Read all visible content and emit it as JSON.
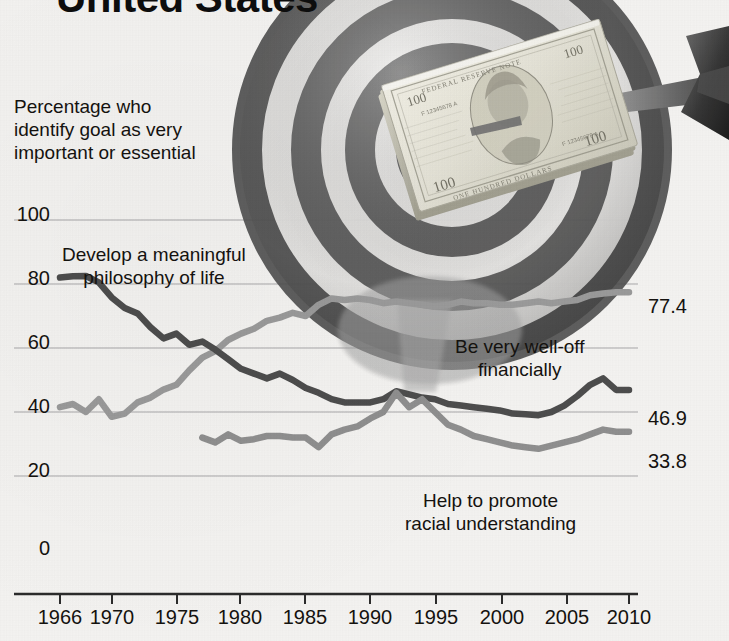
{
  "headline": "United States",
  "axis_note": "Percentage who\nidentify goal as very\nimportant or essential",
  "annotations": {
    "philosophy": "Develop a meaningful\nphilosophy of life",
    "wealth": "Be very well-off\nfinancially",
    "racial": "Help to promote\nracial understanding"
  },
  "end_labels": {
    "wealth": "77.4",
    "philosophy": "46.9",
    "racial": "33.8"
  },
  "y_ticks": [
    "100",
    "80",
    "60",
    "40",
    "20",
    "0"
  ],
  "x_ticks": [
    "1966",
    "1970",
    "1975",
    "1980",
    "1985",
    "1990",
    "1995",
    "2000",
    "2005",
    "2010"
  ],
  "colors": {
    "philosophy_line": "#4d4d4d",
    "wealth_line": "#9a9a9a",
    "racial_line": "#8f8f8f",
    "gridline": "#b9b9b9",
    "axis": "#2b2b2b",
    "text": "#14120f",
    "background": "#f4f3f1"
  },
  "imagery": {
    "dartboard": "dartboard-photo",
    "dart": "dart-photo",
    "money": "hundred-dollar-bills-photo"
  },
  "chart_data": {
    "type": "line",
    "title": "United States",
    "subtitle": "Percentage who identify goal as very important or essential",
    "xlabel": "",
    "ylabel": "Percentage",
    "xlim": [
      1966,
      2010
    ],
    "ylim": [
      0,
      100
    ],
    "grid": true,
    "legend": "inline-annotations",
    "x": [
      1966,
      1967,
      1968,
      1969,
      1970,
      1971,
      1972,
      1973,
      1974,
      1975,
      1976,
      1977,
      1978,
      1979,
      1980,
      1981,
      1982,
      1983,
      1984,
      1985,
      1986,
      1987,
      1988,
      1989,
      1990,
      1991,
      1992,
      1993,
      1994,
      1995,
      1996,
      1997,
      1998,
      1999,
      2000,
      2001,
      2002,
      2003,
      2004,
      2005,
      2006,
      2007,
      2008,
      2009
    ],
    "series": [
      {
        "name": "Develop a meaningful philosophy of life",
        "color": "#4d4d4d",
        "end_value": 46.9,
        "values": [
          82.0,
          82.4,
          82.5,
          80.5,
          75.8,
          72.5,
          70.8,
          66.5,
          63.0,
          64.5,
          61.0,
          62.0,
          59.5,
          56.5,
          53.5,
          52.0,
          50.5,
          52.0,
          50.0,
          47.5,
          46.0,
          44.0,
          43.0,
          43.0,
          43.0,
          44.0,
          46.5,
          45.5,
          44.5,
          44.0,
          42.5,
          42.0,
          41.5,
          41.0,
          40.5,
          39.5,
          39.3,
          39.0,
          40.0,
          42.0,
          45.0,
          48.5,
          50.5,
          46.9
        ]
      },
      {
        "name": "Be very well-off financially",
        "color": "#9a9a9a",
        "end_value": 77.4,
        "values": [
          41.5,
          42.5,
          40.0,
          44.0,
          38.5,
          39.5,
          43.0,
          44.5,
          47.0,
          48.5,
          53.0,
          57.0,
          59.0,
          62.5,
          64.5,
          66.0,
          68.5,
          69.5,
          71.0,
          70.0,
          73.5,
          75.5,
          75.0,
          75.5,
          75.0,
          74.0,
          74.5,
          74.0,
          73.5,
          73.0,
          73.5,
          74.5,
          74.0,
          74.0,
          73.5,
          73.5,
          74.0,
          74.5,
          74.0,
          74.5,
          75.0,
          76.5,
          77.0,
          77.4
        ]
      },
      {
        "name": "Help to promote racial understanding",
        "color": "#8f8f8f",
        "end_value": 33.8,
        "values": [
          null,
          null,
          null,
          null,
          null,
          null,
          null,
          null,
          null,
          null,
          null,
          32.0,
          30.5,
          33.0,
          31.0,
          31.5,
          32.5,
          32.5,
          32.0,
          32.0,
          29.0,
          33.0,
          34.5,
          35.5,
          38.0,
          40.0,
          46.0,
          41.5,
          44.0,
          40.0,
          36.0,
          34.5,
          32.5,
          31.5,
          30.5,
          29.5,
          29.0,
          28.5,
          29.5,
          30.5,
          31.5,
          33.0,
          34.5,
          33.8
        ]
      }
    ]
  }
}
